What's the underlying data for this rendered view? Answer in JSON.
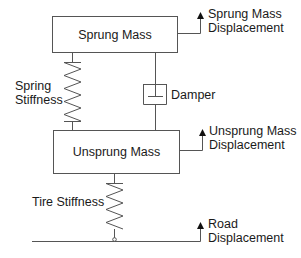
{
  "diagram": {
    "type": "quarter-car suspension model",
    "line_color": "#444444",
    "text_color": "#1a1a1a",
    "blocks": {
      "sprung_mass": {
        "label": "Sprung Mass"
      },
      "unsprung_mass": {
        "label": "Unsprung Mass"
      }
    },
    "components": {
      "spring": {
        "label_line1": "Spring",
        "label_line2": "Stiffness"
      },
      "damper": {
        "label": "Damper"
      },
      "tire": {
        "label": "Tire Stiffness"
      }
    },
    "outputs": {
      "sprung_displacement": {
        "line1": "Sprung Mass",
        "line2": "Displacement"
      },
      "unsprung_displacement": {
        "line1": "Unsprung Mass",
        "line2": "Displacement"
      },
      "road_displacement": {
        "line1": "Road",
        "line2": "Displacement"
      }
    }
  }
}
